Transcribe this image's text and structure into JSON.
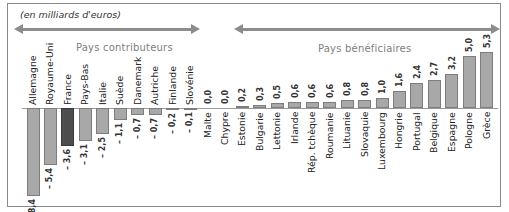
{
  "chart_data": {
    "type": "bar",
    "title": "",
    "unit_label": "(en milliards d'euros)",
    "xlabel": "",
    "ylabel": "",
    "ylim": [
      -8.4,
      5.3
    ],
    "grid": false,
    "groups": [
      {
        "label": "Pays contributeurs",
        "arrow": "both"
      },
      {
        "label": "Pays bénéficiaires",
        "arrow": "both"
      }
    ],
    "highlight": "France",
    "colors": {
      "bar": "#a8a8a8",
      "highlight": "#4d4d4d",
      "group_label": "#808080",
      "arrow": "#8c8c8c"
    },
    "categories": [
      "Allemagne",
      "Royaume-Uni",
      "France",
      "Pays-Bas",
      "Italie",
      "Suède",
      "Danemark",
      "Autriche",
      "Finlande",
      "Slovénie",
      "Malte",
      "Chypre",
      "Estonie",
      "Bulgarie",
      "Lettonie",
      "Irlande",
      "Rép. tchèque",
      "Roumanie",
      "Lituanie",
      "Slovaquie",
      "Luxembourg",
      "Hongrie",
      "Portugal",
      "Belgique",
      "Espagne",
      "Pologne",
      "Grèce"
    ],
    "values": [
      -8.4,
      -5.4,
      -3.6,
      -3.1,
      -2.5,
      -1.1,
      -0.7,
      -0.7,
      -0.2,
      -0.1,
      0.0,
      0.0,
      0.2,
      0.3,
      0.5,
      0.6,
      0.6,
      0.6,
      0.8,
      0.8,
      1.0,
      1.6,
      2.4,
      2.7,
      3.2,
      5.0,
      5.3
    ],
    "value_labels": [
      "– 8,4",
      "– 5,4",
      "– 3,6",
      "– 3,1",
      "– 2,5",
      "– 1,1",
      "– 0,7",
      "– 0,7",
      "– 0,2",
      "– 0,1",
      "0,0",
      "0,0",
      "0,2",
      "0,3",
      "0,5",
      "0,6",
      "0,6",
      "0,6",
      "0,8",
      "0,8",
      "1,0",
      "1,6",
      "2,4",
      "2,7",
      "3,2",
      "5,0",
      "5,3"
    ]
  }
}
